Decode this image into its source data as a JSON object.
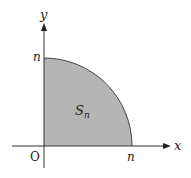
{
  "diagram": {
    "x_axis_label": "x",
    "y_axis_label": "y",
    "origin_label": "O",
    "x_intercept_label": "n",
    "y_intercept_label": "n",
    "region_label": "S",
    "region_subscript": "n",
    "region_fill": "#b3b3b3",
    "axis_color": "#333333"
  }
}
